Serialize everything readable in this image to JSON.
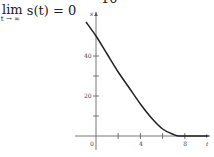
{
  "header": {
    "top_number": "10",
    "formula_lim": "lim",
    "formula_sub": "t → ∞",
    "formula_body": "s(t) = 0"
  },
  "chart_data": {
    "type": "line",
    "title": "",
    "xlabel": "t",
    "ylabel": "s",
    "x_ticks": [
      0,
      2,
      4,
      6,
      8
    ],
    "x_tick_labels": [
      "0",
      "4",
      "8"
    ],
    "y_ticks": [
      10,
      20,
      30,
      40
    ],
    "y_tick_labels": [
      "20",
      "40"
    ],
    "xlim": [
      -1.2,
      10.5
    ],
    "ylim": [
      -8,
      60
    ],
    "grid": false,
    "series": [
      {
        "name": "s(t)",
        "x": [
          -0.9,
          0,
          1,
          2,
          3,
          4,
          5,
          6,
          7,
          7.5,
          8,
          9,
          10
        ],
        "y": [
          57,
          50,
          41,
          32,
          24,
          16,
          9,
          3.5,
          0.7,
          0,
          0,
          0,
          0
        ]
      }
    ]
  }
}
